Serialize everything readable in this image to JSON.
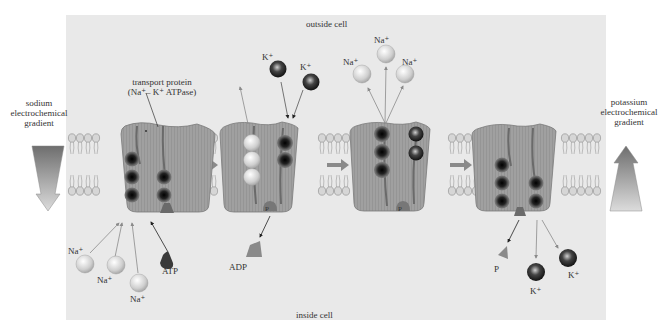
{
  "diagram": {
    "regions": {
      "outside_label": "outside cell",
      "inside_label": "inside cell"
    },
    "protein_label": {
      "line1": "transport protein",
      "line2": "(Na⁺– K⁺ ATPase)"
    },
    "gradients": {
      "sodium": {
        "line1": "sodium",
        "line2": "electrochemical",
        "line3": "gradient",
        "direction": "down"
      },
      "potassium": {
        "line1": "potassium",
        "line2": "electrochemical",
        "line3": "gradient",
        "direction": "up"
      }
    },
    "stages": [
      {
        "id": 1,
        "desc": "3 Na+ bind from inside; ATP binds",
        "labels": [
          "Na⁺",
          "Na⁺",
          "Na⁺",
          "ATP"
        ]
      },
      {
        "id": 2,
        "desc": "Phosphorylation; ADP released; 2 K+ bind from outside",
        "labels": [
          "K⁺",
          "K⁺",
          "ADP",
          "P"
        ]
      },
      {
        "id": 3,
        "desc": "3 Na+ released outside",
        "labels": [
          "Na⁺",
          "Na⁺",
          "Na⁺",
          "P"
        ]
      },
      {
        "id": 4,
        "desc": "Dephosphorylation; P released; 2 K+ released inside",
        "labels": [
          "P",
          "K⁺",
          "K⁺"
        ]
      }
    ],
    "ion_labels": {
      "na": "Na⁺",
      "k": "K⁺",
      "atp": "ATP",
      "adp": "ADP",
      "p": "P"
    },
    "colors": {
      "background_panel": "#e9e9e9",
      "protein": "#9a9a9a",
      "na_ion": "#d8d8d8",
      "k_ion": "#2a2a2a",
      "arrow": "#8a8a8a",
      "text": "#333333"
    }
  }
}
